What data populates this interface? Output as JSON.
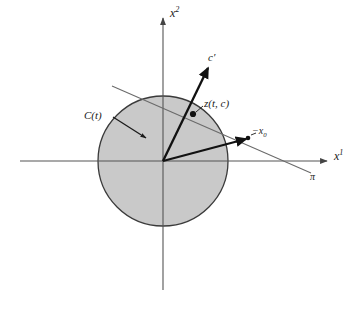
{
  "figure": {
    "domain": "mathematical-diagram",
    "background_color": "#ffffff",
    "stroke_color": "#1a1a1a",
    "axis_color": "#555555",
    "line_color": "#666666",
    "set_fill_color": "#c9c9c9",
    "set_stroke_color": "#3a3a3a",
    "width": 355,
    "height": 317
  },
  "axes": {
    "x_axis": {
      "label_text": "x",
      "label_superscript": "1",
      "y_position": 161,
      "x_start": 20,
      "x_end": 330,
      "arrow": "right"
    },
    "y_axis": {
      "label_text": "x",
      "label_superscript": "2",
      "x_position": 163,
      "y_start": 290,
      "y_end": 16,
      "arrow": "up"
    },
    "origin": {
      "x": 163,
      "y": 161
    }
  },
  "convex_set": {
    "name": "C(t)",
    "label_text": "C(t)",
    "center_x": 163,
    "center_y": 161,
    "radius": 65,
    "fill": "#c9c9c9",
    "stroke": "#3a3a3a",
    "leader": {
      "from_x": 117,
      "from_y": 116,
      "to_x": 148,
      "to_y": 137
    }
  },
  "hyperplane": {
    "name": "pi",
    "label_text": "π",
    "x1": 112,
    "y1": 86,
    "x2": 311,
    "y2": 173
  },
  "vectors": [
    {
      "name": "c-prime",
      "label_text": "c′",
      "from_x": 163,
      "from_y": 161,
      "to_x": 209,
      "to_y": 66
    },
    {
      "name": "minus-x0",
      "label_text": "−x",
      "label_subscript": "0",
      "from_x": 163,
      "from_y": 161,
      "to_x": 248,
      "to_y": 138
    }
  ],
  "points": [
    {
      "name": "z-t-c",
      "label_text": "z(t, c)",
      "x": 193,
      "y": 114,
      "leader_from_x": 201,
      "leader_from_y": 107,
      "leader_to_x": 196,
      "leader_to_y": 112
    },
    {
      "name": "minus-x0-point",
      "label_text": "",
      "x": 248,
      "y": 138
    }
  ]
}
